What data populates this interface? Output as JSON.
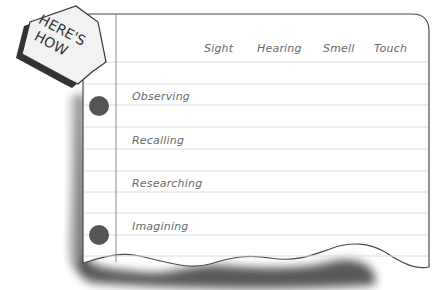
{
  "badge": {
    "line1": "HERE'S",
    "line2": "HOW"
  },
  "columns": [
    {
      "label": "Sight"
    },
    {
      "label": "Hearing"
    },
    {
      "label": "Smell"
    },
    {
      "label": "Touch"
    }
  ],
  "rows": [
    {
      "label": "Observing"
    },
    {
      "label": "Recalling"
    },
    {
      "label": "Researching"
    },
    {
      "label": "Imagining"
    }
  ],
  "colors": {
    "paper": "#ffffff",
    "rule_line": "#dcdcdc",
    "border": "#4a4a4a",
    "hole": "#555555",
    "text": "#6a6a6a",
    "shadow": "#3a3a3a"
  }
}
